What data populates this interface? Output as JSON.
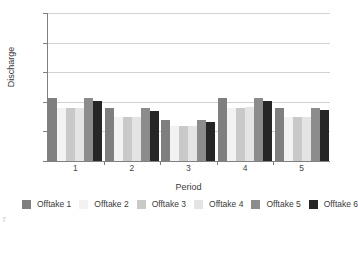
{
  "chart_data": {
    "type": "bar",
    "title": "",
    "xlabel": "Period",
    "ylabel": "Discharge",
    "categories": [
      "1",
      "2",
      "3",
      "4",
      "5"
    ],
    "ylim": [
      0,
      2.5
    ],
    "ytick_values": [
      0,
      0.5,
      1.0,
      1.5,
      2.0,
      2.5
    ],
    "ytick_labels": [
      "0",
      "0.5",
      "1.0",
      "1.5",
      "2.0",
      "2.5"
    ],
    "grid": true,
    "grid_axis": "y",
    "legend_position": "below-left",
    "legend_columns": 2,
    "series": [
      {
        "name": "Offtake 1",
        "color": "#7f7f7f",
        "values": [
          1.07,
          0.89,
          0.7,
          1.07,
          0.89
        ]
      },
      {
        "name": "Offtake 2",
        "color": "#f2f2f2",
        "values": [
          0.89,
          0.74,
          0.59,
          0.89,
          0.74
        ]
      },
      {
        "name": "Offtake 3",
        "color": "#c9c9c9",
        "values": [
          0.89,
          0.74,
          0.59,
          0.89,
          0.74
        ]
      },
      {
        "name": "Offtake 4",
        "color": "#e4e4e4",
        "values": [
          0.89,
          0.74,
          0.59,
          0.91,
          0.74
        ]
      },
      {
        "name": "Offtake 5",
        "color": "#8c8c8c",
        "values": [
          1.07,
          0.89,
          0.7,
          1.07,
          0.89
        ]
      },
      {
        "name": "Offtake 6",
        "color": "#262626",
        "values": [
          1.01,
          0.85,
          0.66,
          1.01,
          0.86
        ]
      }
    ]
  },
  "axes": {
    "ylabel": "Discharge",
    "xlabel": "Period"
  },
  "artifact": {
    "left_edge_mark": "r"
  }
}
